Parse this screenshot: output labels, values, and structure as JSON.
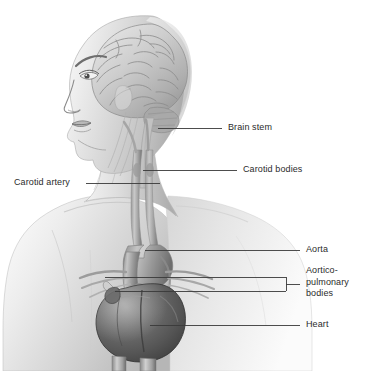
{
  "figure": {
    "orientation": "left profile",
    "style": "grayscale medical illustration",
    "background_color": "#ffffff",
    "line_color": "#3a3a3a",
    "text_color": "#2b2b2b",
    "width": 381,
    "height": 371
  },
  "labels": [
    {
      "id": "brain-stem",
      "text": "Brain stem",
      "side": "right",
      "x": 228,
      "y": 122,
      "leader": {
        "type": "line",
        "x1": 158,
        "y1": 128,
        "x2": 222,
        "y2": 128
      }
    },
    {
      "id": "carotid-bodies",
      "text": "Carotid bodies",
      "side": "right",
      "x": 243,
      "y": 164,
      "leader": {
        "type": "line",
        "x1": 143,
        "y1": 170,
        "x2": 237,
        "y2": 170
      }
    },
    {
      "id": "carotid-artery",
      "text": "Carotid artery",
      "side": "left",
      "x": 14,
      "y": 177,
      "leader": {
        "type": "line",
        "x1": 86,
        "y1": 183,
        "x2": 160,
        "y2": 183
      }
    },
    {
      "id": "aorta",
      "text": "Aorta",
      "side": "right",
      "x": 306,
      "y": 244,
      "leader": {
        "type": "line",
        "x1": 145,
        "y1": 250,
        "x2": 300,
        "y2": 250
      }
    },
    {
      "id": "aortico-pulmonary-bodies",
      "text": "Aortico-\npulmonary\nbodies",
      "side": "right",
      "x": 306,
      "y": 265,
      "leader": {
        "type": "bracket",
        "x1": 105,
        "y1": 277,
        "x2": 286,
        "y2": 291,
        "stem_x": 300
      }
    },
    {
      "id": "heart",
      "text": "Heart",
      "side": "right",
      "x": 306,
      "y": 319,
      "leader": {
        "type": "line",
        "x1": 150,
        "y1": 325,
        "x2": 300,
        "y2": 325
      }
    }
  ],
  "anatomy": [
    {
      "id": "head",
      "name": "Head and face in profile"
    },
    {
      "id": "brain",
      "name": "Brain (cerebrum with gyri and sulci)"
    },
    {
      "id": "brain-stem",
      "name": "Brain stem"
    },
    {
      "id": "neck",
      "name": "Neck"
    },
    {
      "id": "carotid-artery",
      "name": "Carotid artery"
    },
    {
      "id": "carotid-bodies",
      "name": "Carotid bodies"
    },
    {
      "id": "torso",
      "name": "Upper torso and shoulders"
    },
    {
      "id": "aorta",
      "name": "Aorta and aortic arch"
    },
    {
      "id": "aortico-pulmonary-bodies",
      "name": "Aortico-pulmonary bodies"
    },
    {
      "id": "heart",
      "name": "Heart"
    },
    {
      "id": "descending-vessels",
      "name": "Descending vessels"
    }
  ]
}
